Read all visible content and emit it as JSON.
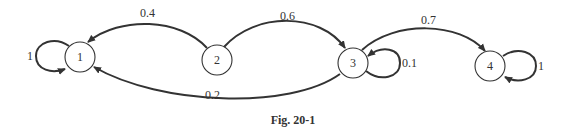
{
  "diagram": {
    "type": "markov-chain-state-diagram",
    "caption": "Fig. 20-1",
    "nodes": [
      {
        "id": "1",
        "label": "1"
      },
      {
        "id": "2",
        "label": "2"
      },
      {
        "id": "3",
        "label": "3"
      },
      {
        "id": "4",
        "label": "4"
      }
    ],
    "edges": [
      {
        "from": "1",
        "to": "1",
        "label": "1"
      },
      {
        "from": "2",
        "to": "1",
        "label": "0.4"
      },
      {
        "from": "2",
        "to": "3",
        "label": "0.6"
      },
      {
        "from": "3",
        "to": "3",
        "label": "0.1"
      },
      {
        "from": "3",
        "to": "1",
        "label": "0.2"
      },
      {
        "from": "3",
        "to": "4",
        "label": "0.7"
      },
      {
        "from": "4",
        "to": "4",
        "label": "1"
      }
    ]
  }
}
